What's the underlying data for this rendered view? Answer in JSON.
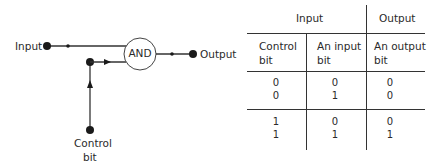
{
  "diagram": {
    "input_label": "Input",
    "output_label": "Output",
    "gate_label": "AND",
    "control_label_line1": "Control",
    "control_label_line2": "bit",
    "line_color": "#333333"
  },
  "table": {
    "group_headers": {
      "input": "Input",
      "output": "Output"
    },
    "columns": [
      {
        "line1": "Control",
        "line2": "bit"
      },
      {
        "line1": "An input",
        "line2": "bit"
      },
      {
        "line1": "An output",
        "line2": "bit"
      }
    ],
    "row_groups": [
      {
        "rows": [
          {
            "control": "0",
            "input": "0",
            "output": "0"
          },
          {
            "control": "0",
            "input": "1",
            "output": "0"
          }
        ]
      },
      {
        "rows": [
          {
            "control": "1",
            "input": "0",
            "output": "0"
          },
          {
            "control": "1",
            "input": "1",
            "output": "1"
          }
        ]
      }
    ]
  }
}
